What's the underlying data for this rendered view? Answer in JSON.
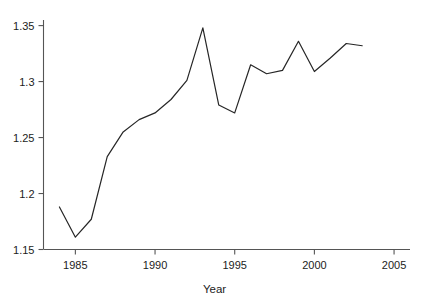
{
  "chart_data": {
    "type": "line",
    "title": "",
    "subtitle": "",
    "xlabel": "Year",
    "ylabel": "",
    "xlim": [
      1983.0,
      2006.0
    ],
    "ylim": [
      1.15,
      1.355
    ],
    "grid": false,
    "legend": null,
    "x_ticks": [
      1985,
      1990,
      1995,
      2000,
      2005
    ],
    "x_tick_labels": [
      "1985",
      "1990",
      "1995",
      "2000",
      "2005"
    ],
    "y_ticks": [
      1.15,
      1.2,
      1.25,
      1.3,
      1.35
    ],
    "y_tick_labels": [
      "1.15",
      "1.2",
      "1.25",
      "1.3",
      "1.35"
    ],
    "series": [
      {
        "name": "value",
        "color": "#262626",
        "line_width": 1.2,
        "marker": "none",
        "x": [
          1984,
          1985,
          1986,
          1987,
          1988,
          1989,
          1990,
          1991,
          1992,
          1993,
          1994,
          1995,
          1996,
          1997,
          1998,
          1999,
          2000,
          2001,
          2002,
          2003
        ],
        "values": [
          1.188,
          1.161,
          1.177,
          1.233,
          1.255,
          1.266,
          1.272,
          1.284,
          1.301,
          1.348,
          1.279,
          1.272,
          1.315,
          1.307,
          1.31,
          1.336,
          1.309,
          1.321,
          1.334,
          1.332
        ]
      }
    ],
    "annotations": []
  },
  "axes": {
    "axis_color": "#555555",
    "tick_color": "#555555",
    "background": "#ffffff"
  }
}
